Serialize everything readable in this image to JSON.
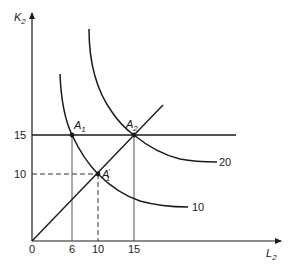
{
  "diagram": {
    "type": "isoquant-expansion-path",
    "axes": {
      "y": {
        "label": "K",
        "subscript": "2",
        "ticks": [
          {
            "value": "15",
            "py": 135
          },
          {
            "value": "10",
            "py": 174
          }
        ]
      },
      "x": {
        "label": "L",
        "subscript": "2",
        "ticks": [
          {
            "value": "0",
            "px": 32
          },
          {
            "value": "6",
            "px": 72
          },
          {
            "value": "10",
            "px": 98
          },
          {
            "value": "15",
            "px": 134
          }
        ]
      }
    },
    "points": [
      {
        "id": "A1",
        "label": "A",
        "subscript": "1",
        "prime": false,
        "x": 6,
        "y": 15
      },
      {
        "id": "A2",
        "label": "A",
        "subscript": "2",
        "prime": false,
        "x": 15,
        "y": 15
      },
      {
        "id": "A1prime",
        "label": "A",
        "subscript": "1",
        "prime": true,
        "x": 10,
        "y": 10
      }
    ],
    "curves": [
      {
        "id": "isoquant-10",
        "label": "10"
      },
      {
        "id": "isoquant-20",
        "label": "20"
      }
    ],
    "lines": [
      {
        "id": "ray-from-origin",
        "description": "expansion path through A1' and A2"
      },
      {
        "id": "horizontal-K15",
        "description": "K2 = 15 constraint"
      }
    ]
  },
  "labels": {
    "y_axis": "K",
    "y_axis_sub": "2",
    "x_axis": "L",
    "x_axis_sub": "2",
    "y_tick_15": "15",
    "y_tick_10": "10",
    "x_tick_0": "0",
    "x_tick_6": "6",
    "x_tick_10": "10",
    "x_tick_15": "15",
    "point_A1": "A",
    "point_A1_sub": "1",
    "point_A2": "A",
    "point_A2_sub": "2",
    "point_A1p": "A",
    "point_A1p_prime": "′",
    "point_A1p_sub": "1",
    "curve_10": "10",
    "curve_20": "20"
  },
  "colors": {
    "ink": "#1a1a1a",
    "grid": "#555555",
    "background": "#ffffff"
  }
}
